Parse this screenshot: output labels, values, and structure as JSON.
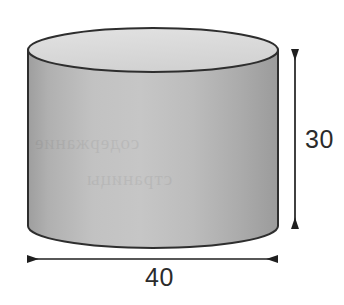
{
  "figure": {
    "kind": "cylinder-diagram",
    "shape_name": "cylinder",
    "background_color": "#ffffff",
    "outline_color": "#2e2e2e",
    "top_face_color": "#d9d9d9",
    "body_color_light": "#bdbdbd",
    "body_color_dark": "#a3a3a3",
    "label_color": "#2b2b2b"
  },
  "dimensions": {
    "height": {
      "value": "30",
      "orientation": "vertical",
      "arrow_style": "double-headed"
    },
    "diameter": {
      "value": "40",
      "orientation": "horizontal",
      "arrow_style": "double-headed"
    }
  },
  "artifacts": {
    "bleed_through_line_1": "содержание",
    "bleed_through_line_2": "страницы"
  }
}
